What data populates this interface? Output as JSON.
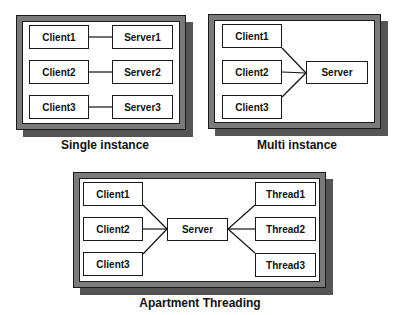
{
  "diagrams": [
    {
      "id": "single",
      "caption": "Single instance",
      "clients": [
        "Client1",
        "Client2",
        "Client3"
      ],
      "servers": [
        "Server1",
        "Server2",
        "Server3"
      ]
    },
    {
      "id": "multi",
      "caption": "Multi instance",
      "clients": [
        "Client1",
        "Client2",
        "Client3"
      ],
      "server": "Server"
    },
    {
      "id": "apartment",
      "caption": "Apartment Threading",
      "clients": [
        "Client1",
        "Client2",
        "Client3"
      ],
      "server": "Server",
      "threads": [
        "Thread1",
        "Thread2",
        "Thread3"
      ]
    }
  ],
  "colors": {
    "frame": "#7a7a7a",
    "shadow": "#555555",
    "line": "#111111",
    "box_fill": "#ffffff"
  }
}
